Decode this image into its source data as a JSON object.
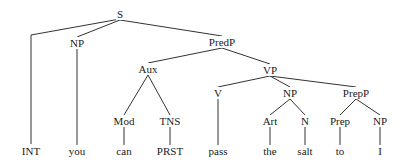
{
  "diagram": {
    "type": "syntax-tree",
    "line_color": "#333333",
    "nodes": [
      {
        "id": "s",
        "label": "S",
        "x": 120,
        "y": 14
      },
      {
        "id": "np1",
        "label": "NP",
        "x": 77,
        "y": 43
      },
      {
        "id": "predp",
        "label": "PredP",
        "x": 222,
        "y": 42
      },
      {
        "id": "aux",
        "label": "Aux",
        "x": 148,
        "y": 69
      },
      {
        "id": "vp",
        "label": "VP",
        "x": 270,
        "y": 70
      },
      {
        "id": "v",
        "label": "V",
        "x": 218,
        "y": 93
      },
      {
        "id": "np2",
        "label": "NP",
        "x": 290,
        "y": 93
      },
      {
        "id": "prepp",
        "label": "PrepP",
        "x": 356,
        "y": 93
      },
      {
        "id": "mod",
        "label": "Mod",
        "x": 124,
        "y": 121
      },
      {
        "id": "tns",
        "label": "TNS",
        "x": 170,
        "y": 121
      },
      {
        "id": "art",
        "label": "Art",
        "x": 270,
        "y": 121
      },
      {
        "id": "n",
        "label": "N",
        "x": 305,
        "y": 121
      },
      {
        "id": "prep",
        "label": "Prep",
        "x": 340,
        "y": 121
      },
      {
        "id": "np3",
        "label": "NP",
        "x": 380,
        "y": 121
      },
      {
        "id": "int",
        "label": "INT",
        "x": 31,
        "y": 151
      },
      {
        "id": "you",
        "label": "you",
        "x": 77,
        "y": 151
      },
      {
        "id": "can",
        "label": "can",
        "x": 124,
        "y": 151
      },
      {
        "id": "prst",
        "label": "PRST",
        "x": 170,
        "y": 151
      },
      {
        "id": "pass",
        "label": "pass",
        "x": 218,
        "y": 151
      },
      {
        "id": "the",
        "label": "the",
        "x": 270,
        "y": 151
      },
      {
        "id": "salt",
        "label": "salt",
        "x": 305,
        "y": 151
      },
      {
        "id": "to",
        "label": "to",
        "x": 340,
        "y": 151
      },
      {
        "id": "i",
        "label": "I",
        "x": 380,
        "y": 151
      }
    ],
    "edges": [
      {
        "from": "s",
        "to": "int",
        "elbow": true
      },
      {
        "from": "s",
        "to": "np1"
      },
      {
        "from": "s",
        "to": "predp"
      },
      {
        "from": "np1",
        "to": "you"
      },
      {
        "from": "predp",
        "to": "aux"
      },
      {
        "from": "predp",
        "to": "vp"
      },
      {
        "from": "aux",
        "to": "mod"
      },
      {
        "from": "aux",
        "to": "tns"
      },
      {
        "from": "mod",
        "to": "can"
      },
      {
        "from": "tns",
        "to": "prst"
      },
      {
        "from": "vp",
        "to": "v"
      },
      {
        "from": "vp",
        "to": "np2"
      },
      {
        "from": "vp",
        "to": "prepp"
      },
      {
        "from": "v",
        "to": "pass"
      },
      {
        "from": "np2",
        "to": "art"
      },
      {
        "from": "np2",
        "to": "n"
      },
      {
        "from": "art",
        "to": "the"
      },
      {
        "from": "n",
        "to": "salt"
      },
      {
        "from": "prepp",
        "to": "prep"
      },
      {
        "from": "prepp",
        "to": "np3"
      },
      {
        "from": "prep",
        "to": "to"
      },
      {
        "from": "np3",
        "to": "i"
      }
    ]
  }
}
